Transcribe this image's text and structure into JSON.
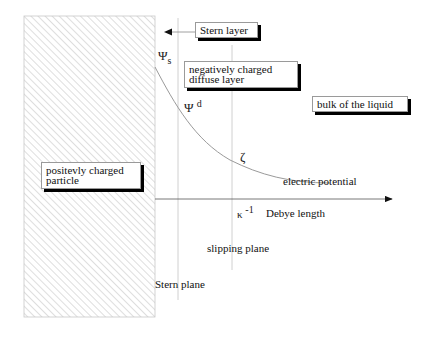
{
  "labels": {
    "stern_layer": "Stern layer",
    "diffuse_layer_line1": "negatively charged",
    "diffuse_layer_line2": "diffuse layer",
    "bulk": "bulk of the liquid",
    "particle_line1": "positevly charged",
    "particle_line2": "particle",
    "electric_potential": "electric potential",
    "debye_length": "Debye length",
    "slipping_plane": "slipping plane",
    "stern_plane": "Stern plane"
  },
  "symbols": {
    "psi": "Ψ",
    "psi_s_sub": "s",
    "psi_d_sup": "d",
    "zeta": "ζ",
    "kappa": "κ",
    "kappa_sup": "-1"
  },
  "colors": {
    "hatch": "#bdbdbd",
    "curve": "#9a9a9a",
    "axis": "#555555",
    "guide": "#d0d0d0"
  }
}
